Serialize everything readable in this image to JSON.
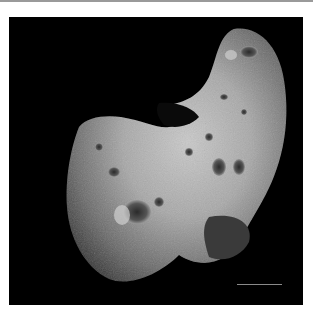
{
  "image": {
    "subject": "asteroid",
    "alt": "Photograph of an elongated, cratered asteroid against a black background",
    "background_color": "#000000",
    "frame_border_color": "#9a9a9a"
  }
}
